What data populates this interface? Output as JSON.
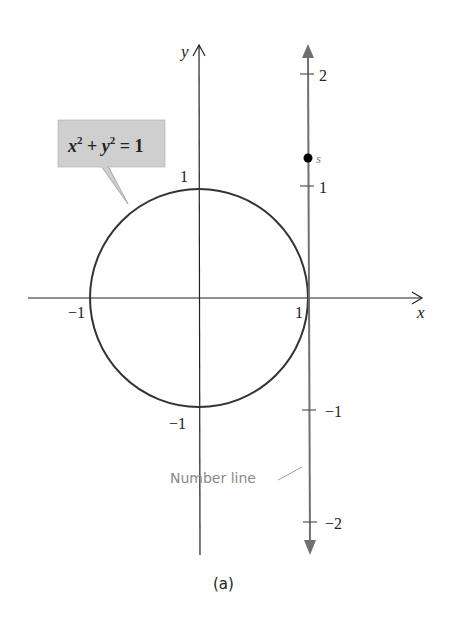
{
  "figure": {
    "caption": "(a)",
    "axes": {
      "x_label": "x",
      "y_label": "y",
      "x_ticks": {
        "neg": "−1",
        "pos": "1"
      },
      "y_ticks": {
        "pos": "1",
        "neg": "−1"
      }
    },
    "circle": {
      "equation_x": "x",
      "equation_exp1": "2",
      "equation_plus": " + ",
      "equation_y": "y",
      "equation_exp2": "2",
      "equation_eq": " = 1",
      "callout_fill": "#cfcfcf"
    },
    "number_line": {
      "label": "Number line",
      "ticks": [
        "2",
        "1",
        "−1",
        "−2"
      ],
      "point_label": "s",
      "color": "#707070"
    }
  }
}
